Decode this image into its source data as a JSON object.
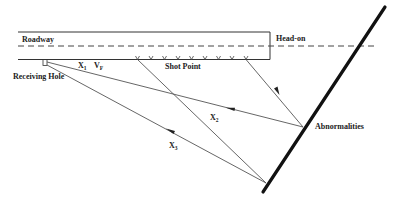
{
  "diagram": {
    "labels": {
      "roadway": "Roadway",
      "head_on": "Head-on",
      "receiving_hole": "Receiving Hole",
      "shot_point": "Shot Point",
      "abnormalities": "Abnormalities",
      "x1": {
        "base": "X",
        "sub": "1"
      },
      "vf": {
        "base": "V",
        "sub": "F"
      },
      "x2": {
        "base": "X",
        "sub": "2"
      },
      "x3": {
        "base": "X",
        "sub": "3"
      }
    },
    "shot_point_count": 9,
    "colors": {
      "line": "#555555",
      "fault": "#111111",
      "text": "#222222",
      "background": "#ffffff"
    }
  }
}
